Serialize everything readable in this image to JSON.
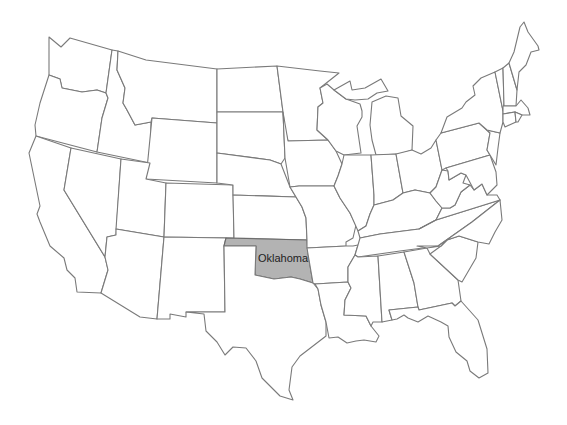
{
  "map": {
    "title": "United States",
    "highlighted_state": {
      "name": "Oklahoma",
      "label": "Oklahoma",
      "fill_color": "#b3b3b3"
    },
    "base_fill_color": "#ffffff",
    "border_color": "#7a7a7a"
  }
}
